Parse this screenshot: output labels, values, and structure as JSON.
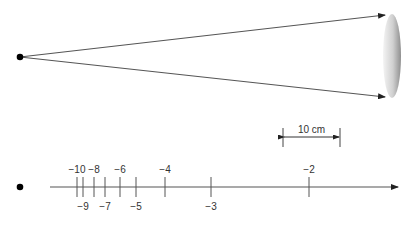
{
  "top_diagram": {
    "source_point": {
      "x": 20,
      "y": 57
    },
    "rays": [
      {
        "from": [
          20,
          57
        ],
        "to": [
          385,
          15
        ]
      },
      {
        "from": [
          20,
          57
        ],
        "to": [
          385,
          97
        ]
      }
    ],
    "lens": {
      "cx": 392,
      "cy": 56,
      "rx": 9,
      "ry": 42
    }
  },
  "scale_bar": {
    "label": "10 cm",
    "x1": 283,
    "x2": 340,
    "y": 137
  },
  "number_line": {
    "point": {
      "x": 20,
      "y": 187
    },
    "axis": {
      "x1": 50,
      "x2": 398,
      "y": 187
    },
    "ticks": [
      {
        "value": -10,
        "label": "−10",
        "x": 77,
        "pos": "above"
      },
      {
        "value": -9,
        "label": "−9",
        "x": 83,
        "pos": "below"
      },
      {
        "value": -8,
        "label": "−8",
        "x": 94,
        "pos": "above"
      },
      {
        "value": -7,
        "label": "−7",
        "x": 105,
        "pos": "below"
      },
      {
        "value": -6,
        "label": "−6",
        "x": 120,
        "pos": "above"
      },
      {
        "value": -5,
        "label": "−5",
        "x": 136,
        "pos": "below"
      },
      {
        "value": -4,
        "label": "−4",
        "x": 165,
        "pos": "above"
      },
      {
        "value": -3,
        "label": "−3",
        "x": 211,
        "pos": "below"
      },
      {
        "value": -2,
        "label": "−2",
        "x": 309,
        "pos": "above"
      }
    ]
  },
  "colors": {
    "line": "#555555",
    "point": "#000000",
    "lens_light": "#f2f2f2",
    "lens_dark": "#9a9a9a"
  }
}
